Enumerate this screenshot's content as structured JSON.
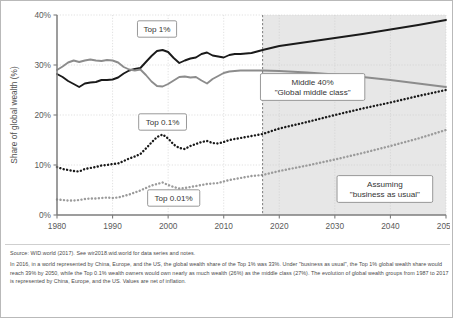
{
  "chart_data": {
    "type": "line",
    "title": "",
    "xlabel": "",
    "ylabel": "Share of global wealth (%)",
    "xlim": [
      1980,
      2050
    ],
    "ylim": [
      0,
      40
    ],
    "xticks": [
      "1980",
      "1990",
      "2000",
      "2010",
      "2020",
      "2030",
      "2040",
      "2050"
    ],
    "yticks": [
      "0%",
      "10%",
      "20%",
      "30%",
      "40%"
    ],
    "grid": true,
    "legend": "inline-callouts",
    "projection_start": 2017,
    "projection_note": "Shaded region from 2017 to 2050 is projected",
    "annotations": [
      {
        "name": "top1-callout",
        "text": "Top 1%",
        "x": 1998,
        "y": 37.2
      },
      {
        "name": "middle40-callout",
        "line1": "Middle 40%",
        "line2": "\"Global middle class\"",
        "x": 2026,
        "y": 25.6
      },
      {
        "name": "top01-callout",
        "text": "Top 0.1%",
        "x": 1999,
        "y": 18.6
      },
      {
        "name": "top001-callout",
        "text": "Top 0.01%",
        "x": 2001,
        "y": 3.4
      },
      {
        "name": "assumption-callout",
        "line1": "Assuming",
        "line2": "\"business as usual\"",
        "x": 2039,
        "y": 5.2
      }
    ],
    "series": [
      {
        "name": "Top 1%",
        "color": "#1a1a1a",
        "style": "solid",
        "x": [
          1980,
          1981,
          1982,
          1983,
          1984,
          1985,
          1986,
          1987,
          1988,
          1989,
          1990,
          1991,
          1992,
          1993,
          1994,
          1995,
          1996,
          1997,
          1998,
          1999,
          2000,
          2001,
          2002,
          2003,
          2004,
          2005,
          2006,
          2007,
          2008,
          2009,
          2010,
          2011,
          2012,
          2013,
          2014,
          2015,
          2016,
          2017,
          2020,
          2025,
          2030,
          2035,
          2040,
          2045,
          2050
        ],
        "values": [
          28.2,
          27.6,
          26.8,
          26.2,
          25.6,
          26.3,
          26.5,
          26.6,
          27.0,
          27.0,
          27.1,
          27.5,
          28.3,
          28.9,
          29.2,
          29.4,
          30.6,
          31.8,
          32.8,
          33.0,
          32.6,
          31.4,
          30.4,
          30.9,
          31.3,
          31.5,
          32.2,
          32.5,
          31.9,
          31.7,
          31.5,
          32.0,
          32.2,
          32.2,
          32.3,
          32.4,
          32.7,
          33.0,
          33.8,
          34.6,
          35.4,
          36.2,
          37.1,
          38.0,
          39.0
        ]
      },
      {
        "name": "Middle 40%",
        "color": "#8c8c8c",
        "style": "solid",
        "x": [
          1980,
          1981,
          1982,
          1983,
          1984,
          1985,
          1986,
          1987,
          1988,
          1989,
          1990,
          1991,
          1992,
          1993,
          1994,
          1995,
          1996,
          1997,
          1998,
          1999,
          2000,
          2001,
          2002,
          2003,
          2004,
          2005,
          2006,
          2007,
          2008,
          2009,
          2010,
          2011,
          2012,
          2013,
          2014,
          2015,
          2016,
          2017,
          2020,
          2025,
          2030,
          2035,
          2040,
          2045,
          2050
        ],
        "values": [
          29.0,
          29.7,
          30.5,
          30.9,
          30.6,
          30.9,
          31.1,
          30.9,
          30.8,
          31.0,
          30.9,
          30.5,
          29.6,
          29.1,
          28.9,
          29.1,
          28.0,
          26.7,
          25.8,
          25.7,
          26.2,
          26.9,
          27.6,
          27.7,
          27.5,
          27.6,
          26.9,
          26.3,
          27.2,
          27.8,
          28.4,
          28.7,
          28.8,
          28.9,
          28.9,
          28.9,
          28.9,
          28.9,
          28.8,
          28.5,
          28.1,
          27.6,
          27.0,
          26.3,
          25.6
        ]
      },
      {
        "name": "Top 0.1%",
        "color": "#1a1a1a",
        "style": "dotted",
        "x": [
          1980,
          1981,
          1982,
          1983,
          1984,
          1985,
          1986,
          1987,
          1988,
          1989,
          1990,
          1991,
          1992,
          1993,
          1994,
          1995,
          1996,
          1997,
          1998,
          1999,
          2000,
          2001,
          2002,
          2003,
          2004,
          2005,
          2006,
          2007,
          2008,
          2009,
          2010,
          2011,
          2012,
          2013,
          2014,
          2015,
          2016,
          2017,
          2020,
          2025,
          2030,
          2035,
          2040,
          2045,
          2050
        ],
        "values": [
          9.6,
          9.2,
          9.0,
          8.8,
          8.7,
          9.2,
          9.4,
          9.6,
          9.9,
          10.0,
          10.2,
          10.3,
          10.8,
          11.3,
          11.7,
          12.2,
          13.3,
          14.5,
          15.6,
          16.1,
          15.3,
          14.1,
          13.4,
          13.2,
          13.8,
          14.2,
          14.6,
          14.8,
          14.4,
          14.3,
          14.6,
          15.0,
          15.2,
          15.4,
          15.6,
          15.8,
          16.0,
          16.2,
          17.3,
          18.6,
          20.0,
          21.3,
          22.5,
          23.8,
          25.0
        ]
      },
      {
        "name": "Top 0.01%",
        "color": "#9b9b9b",
        "style": "dotted",
        "x": [
          1980,
          1981,
          1982,
          1983,
          1984,
          1985,
          1986,
          1987,
          1988,
          1989,
          1990,
          1991,
          1992,
          1993,
          1994,
          1995,
          1996,
          1997,
          1998,
          1999,
          2000,
          2001,
          2002,
          2003,
          2004,
          2005,
          2006,
          2007,
          2008,
          2009,
          2010,
          2011,
          2012,
          2013,
          2014,
          2015,
          2016,
          2017,
          2020,
          2025,
          2030,
          2035,
          2040,
          2045,
          2050
        ],
        "values": [
          3.1,
          3.0,
          2.9,
          2.9,
          3.0,
          3.2,
          3.3,
          3.3,
          3.4,
          3.5,
          3.4,
          3.5,
          3.8,
          4.1,
          4.5,
          4.9,
          5.4,
          5.9,
          6.2,
          6.5,
          6.0,
          5.6,
          5.3,
          5.4,
          5.6,
          5.8,
          6.0,
          6.2,
          6.3,
          6.4,
          6.7,
          7.0,
          7.2,
          7.4,
          7.6,
          7.8,
          7.9,
          8.0,
          8.8,
          9.9,
          11.1,
          12.4,
          13.8,
          15.3,
          17.0
        ]
      }
    ]
  },
  "footer": {
    "source": "Source: WID.world (2017). See wir2018.wid.world for data series and notes.",
    "note": "In 2016, in a world represented by China, Europe, and the US, the global wealth share of the Top 1% was 33%. Under \"business as usual\", the Top 1% global wealth share would reach 39% by 2050, while the Top 0.1% wealth owners would own nearly as much wealth (26%) as the middle class (27%). The evolution of global wealth groups from 1987 to 2017 is represented by China, Europe, and the US. Values are net of inflation."
  },
  "colors": {
    "top1": "#1a1a1a",
    "middle40": "#8c8c8c",
    "top01": "#1a1a1a",
    "top001": "#9b9b9b",
    "projection_shade": "#d4d4d4",
    "grid": "#cccccc",
    "axis": "#7d7d7d"
  }
}
